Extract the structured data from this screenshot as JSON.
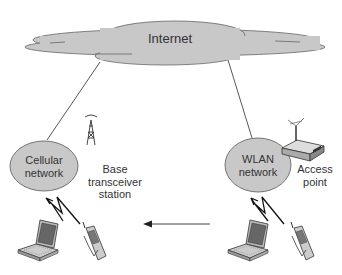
{
  "diagram": {
    "cloud": {
      "label": "Internet",
      "fill": "#c8c8c8"
    },
    "cellular": {
      "label_line1": "Cellular",
      "label_line2": "network"
    },
    "wlan": {
      "label_line1": "WLAN",
      "label_line2": "network"
    },
    "bts": {
      "label_line1": "Base",
      "label_line2": "transceiver",
      "label_line3": "station",
      "icon": "cell-tower-icon"
    },
    "access_point": {
      "label_line1": "Access",
      "label_line2": "point",
      "icon": "router-icon"
    },
    "devices": [
      "laptop-icon",
      "phone-icon"
    ],
    "handover_arrow": {
      "direction": "left",
      "from": "wlan",
      "to": "cellular"
    },
    "colors": {
      "node_fill": "#c8c8c8",
      "stroke": "#555555",
      "text": "#333333"
    }
  }
}
